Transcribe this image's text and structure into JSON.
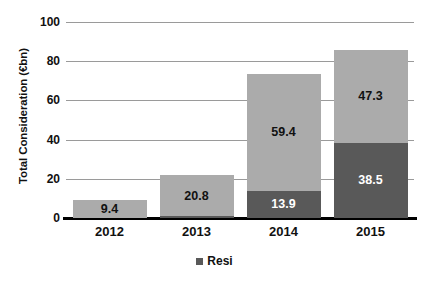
{
  "chart_data": {
    "type": "bar",
    "subtype": "stacked",
    "title": "",
    "xlabel": "",
    "ylabel": "Total Consideration (€bn)",
    "categories": [
      "2012",
      "2013",
      "2014",
      "2015"
    ],
    "ylim": [
      0,
      100
    ],
    "yticks": [
      "0",
      "20",
      "40",
      "60",
      "80",
      "100"
    ],
    "ytick_values": [
      0,
      20,
      40,
      60,
      80,
      100
    ],
    "grid": true,
    "grid_axis": "y",
    "legend": [
      "Resi"
    ],
    "legend_position": "bottom-center",
    "series": [
      {
        "name": "Resi",
        "color": "#595959",
        "label_color": "#ffffff",
        "values": [
          0,
          0.9,
          13.9,
          38.5
        ],
        "labels": [
          "",
          "0.9",
          "13.9",
          "38.5"
        ]
      },
      {
        "name": "Other",
        "color": "#ababab",
        "label_color": "#111111",
        "values": [
          9.4,
          20.8,
          59.4,
          47.3
        ],
        "labels": [
          "9.4",
          "20.8",
          "59.4",
          "47.3"
        ]
      }
    ],
    "totals": [
      9.4,
      21.7,
      73.3,
      85.8
    ]
  },
  "legend": {
    "entries": [
      {
        "label": "Resi",
        "color": "#595959"
      }
    ]
  }
}
